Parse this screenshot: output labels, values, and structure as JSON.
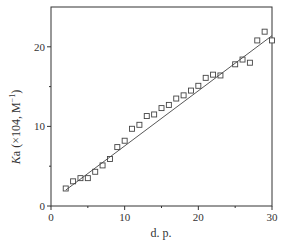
{
  "chart_data": {
    "type": "scatter",
    "title": "",
    "xlabel": "d. p.",
    "ylabel": "Ka (×104, M⁻¹)",
    "ylabel_parts": {
      "italic": "K",
      "rest": "a (×104, M",
      "sup": "−1",
      "close": ")"
    },
    "xlim": [
      0,
      30
    ],
    "ylim": [
      0,
      25
    ],
    "xticks": [
      0,
      10,
      20,
      30
    ],
    "yticks": [
      0,
      10,
      20
    ],
    "xtick_labels": [
      "0",
      "10",
      "20",
      "30"
    ],
    "ytick_labels": [
      "0",
      "10",
      "20"
    ],
    "minor_xticks": [
      5,
      15,
      25
    ],
    "minor_yticks": [
      5,
      15
    ],
    "grid": false,
    "legend": null,
    "series": [
      {
        "name": "measured",
        "marker": "open-square",
        "x": [
          2,
          3,
          4,
          5,
          6,
          7,
          8,
          9,
          10,
          11,
          12,
          13,
          14,
          15,
          16,
          17,
          18,
          19,
          20,
          21,
          22,
          23,
          25,
          26,
          27,
          28,
          29,
          30
        ],
        "y": [
          2.2,
          3.1,
          3.5,
          3.5,
          4.3,
          5.1,
          5.9,
          7.4,
          8.2,
          9.7,
          10.2,
          11.3,
          11.5,
          12.3,
          12.7,
          13.5,
          13.9,
          14.5,
          15.1,
          16.1,
          16.5,
          16.4,
          17.8,
          18.4,
          18.0,
          20.8,
          21.9,
          20.8
        ]
      },
      {
        "name": "linear fit",
        "marker": "line",
        "x": [
          2,
          30
        ],
        "y": [
          2.0,
          21.4
        ]
      }
    ]
  }
}
